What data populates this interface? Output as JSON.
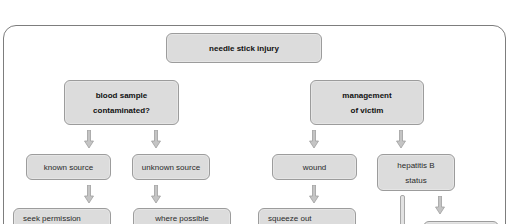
{
  "diagram": {
    "title_node": {
      "label": "needle stick injury"
    },
    "left_branch": {
      "header": {
        "lines": [
          "blood sample",
          "contaminated?"
        ]
      },
      "children": [
        {
          "label": "known source",
          "next": {
            "label": "seek permission"
          }
        },
        {
          "label": "unknown source",
          "next": {
            "label": "where possible"
          }
        }
      ]
    },
    "right_branch": {
      "header": {
        "lines": [
          "management",
          "of victim"
        ]
      },
      "children": [
        {
          "label": "wound",
          "next": {
            "label": "squeeze out"
          }
        },
        {
          "lines": [
            "hepatitis B",
            "status"
          ],
          "next": {
            "label": ""
          }
        }
      ]
    },
    "icons": {
      "arrow": "down-arrow-icon",
      "connector": "vertical-connector-bar"
    },
    "colors": {
      "node_fill": "#dcdcdc",
      "node_border": "#9c9c9c",
      "arrow_fill": "#c4c4c4",
      "arrow_stroke": "#a0a0a0",
      "frame_border": "#7d7d7d"
    }
  }
}
